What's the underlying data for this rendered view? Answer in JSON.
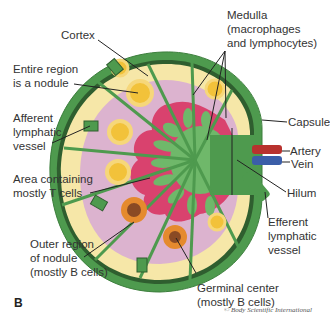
{
  "figure": {
    "panel_letter": "B",
    "copyright": "© Body Scientific International"
  },
  "labels": {
    "cortex": "Cortex",
    "nodule_1": "Entire region",
    "nodule_2": "is a nodule",
    "afferent_1": "Afferent",
    "afferent_2": "lymphatic",
    "afferent_3": "vessel",
    "tcells_1": "Area containing",
    "tcells_2": "mostly T cells",
    "outer_1": "Outer region",
    "outer_2": "of nodule",
    "outer_3": "(mostly B cells)",
    "medulla_1": "Medulla",
    "medulla_2": "(macrophages",
    "medulla_3": "and lymphocytes)",
    "capsule": "Capsule",
    "artery": "Artery",
    "vein": "Vein",
    "hilum": "Hilum",
    "efferent_1": "Efferent",
    "efferent_2": "lymphatic",
    "efferent_3": "vessel",
    "germinal_1": "Germinal center",
    "germinal_2": "(mostly B cells)"
  },
  "colors": {
    "capsule_green": "#4e9a4e",
    "capsule_dark": "#2f5e2f",
    "cortex_yellow": "#f6e7a8",
    "paracortex_pink": "#dcb3cf",
    "medulla_red": "#d9426e",
    "medulla_green": "#6fb86a",
    "nodule_yellow": "#f2c23a",
    "germinal_orange": "#e58a2e",
    "germinal_center": "#8a4a24",
    "artery_red": "#b8322e",
    "vein_blue": "#3b5ea8"
  }
}
